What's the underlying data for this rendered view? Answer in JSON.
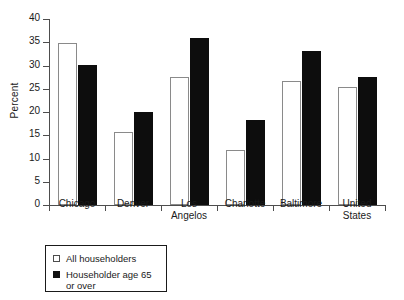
{
  "chart_data": {
    "type": "bar",
    "title": "",
    "xlabel": "",
    "ylabel": "Percent",
    "ylim": [
      0,
      40
    ],
    "yticks": [
      0,
      5,
      10,
      15,
      20,
      25,
      30,
      35,
      40
    ],
    "grid": false,
    "legend_position": "below-left",
    "categories": [
      "Chicago",
      "Denver",
      "Los Angelos",
      "Charlotte",
      "Baltimore",
      "United States"
    ],
    "category_lines": [
      [
        "Chicago"
      ],
      [
        "Denver"
      ],
      [
        "Los",
        "Angelos"
      ],
      [
        "Charlotte"
      ],
      [
        "Baltimore"
      ],
      [
        "United",
        "States"
      ]
    ],
    "series": [
      {
        "name": "All householders",
        "color": "#ffffff",
        "values": [
          34.8,
          15.7,
          27.6,
          11.8,
          26.7,
          25.3
        ]
      },
      {
        "name": "Householder age 65 or over",
        "color": "#0d0d0d",
        "values": [
          30.1,
          20.0,
          36.0,
          18.3,
          33.2,
          27.5
        ]
      }
    ]
  },
  "legend": {
    "items": [
      {
        "label": "All householders",
        "swatch": "light"
      },
      {
        "label": "Householder age 65\nor over",
        "swatch": "dark"
      }
    ]
  },
  "axis": {
    "y_tick_labels": [
      "0",
      "5",
      "10",
      "15",
      "20",
      "25",
      "30",
      "35",
      "40"
    ]
  }
}
